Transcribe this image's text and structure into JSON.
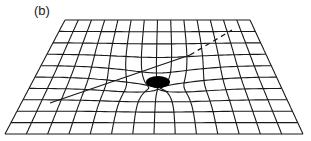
{
  "figure": {
    "panel_label": "(b)",
    "colors": {
      "line": "#1a1a1a",
      "mass": "#000000",
      "background": "#ffffff"
    },
    "grid": {
      "top_left": [
        65,
        20
      ],
      "top_right": [
        250,
        20
      ],
      "bottom_left": [
        5,
        134
      ],
      "bottom_right": [
        303,
        134
      ],
      "rows": 10,
      "cols": 14
    },
    "mass": {
      "cx": 158,
      "cy": 82,
      "rx": 12,
      "ry": 6
    },
    "trajectory": {
      "solid": [
        [
          50,
          103
        ],
        [
          190,
          55
        ]
      ],
      "dashed": [
        [
          190,
          55
        ],
        [
          232,
          30
        ]
      ]
    }
  }
}
